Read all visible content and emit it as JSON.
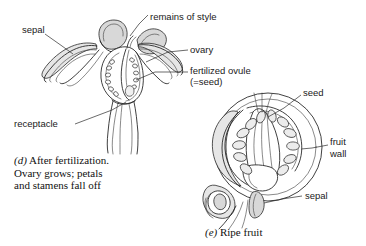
{
  "figure": {
    "background": "#ffffff",
    "ink_color": "#1f1f1f"
  },
  "panels": [
    {
      "id": "d",
      "caption_lines": [
        "(d) After fertilization.",
        "Ovary grows; petals",
        "and stamens fall off"
      ],
      "caption_marker": "(d)",
      "caption_rest": " After fertilization.",
      "labels": [
        {
          "name": "sepal",
          "text": "sepal",
          "x": 22,
          "y": 24
        },
        {
          "name": "remains-of-style",
          "text": "remains of style",
          "x": 150,
          "y": 12
        },
        {
          "name": "ovary",
          "text": "ovary",
          "x": 190,
          "y": 49
        },
        {
          "name": "fertilized-ovule",
          "text": "fertilized ovule",
          "x": 190,
          "y": 70
        },
        {
          "name": "seed-equals",
          "text": "(=seed)",
          "x": 190,
          "y": 80
        }
      ]
    },
    {
      "id": "e",
      "caption_lines": [
        "(e) Ripe fruit"
      ],
      "caption_marker": "(e)",
      "caption_rest": " Ripe fruit",
      "labels": [
        {
          "name": "seed",
          "text": "seed",
          "x": 303,
          "y": 90
        },
        {
          "name": "fruit-wall-line1",
          "text": "fruit",
          "x": 330,
          "y": 140
        },
        {
          "name": "fruit-wall-line2",
          "text": "wall",
          "x": 330,
          "y": 152
        },
        {
          "name": "sepal",
          "text": "sepal",
          "x": 305,
          "y": 192
        }
      ]
    }
  ]
}
